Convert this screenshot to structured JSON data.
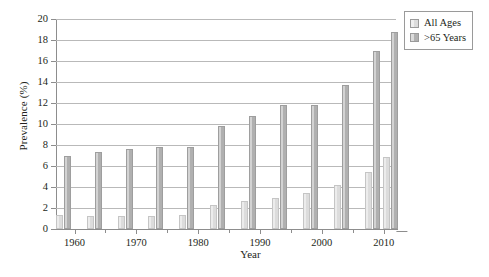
{
  "chart_data": {
    "type": "bar",
    "title": "",
    "xlabel": "Year",
    "ylabel": "Prevalence (%)",
    "grid": true,
    "legend_position": "top-right",
    "ylim": [
      0,
      20
    ],
    "yticks": [
      0,
      2,
      4,
      6,
      8,
      10,
      12,
      14,
      16,
      18,
      20
    ],
    "xlim": [
      1957,
      2012
    ],
    "xticks": [
      1960,
      1970,
      1980,
      1990,
      2000,
      2010
    ],
    "xtick_labels": [
      "1960",
      "1970",
      "1980",
      "1990",
      "2000",
      "2010"
    ],
    "categories": [
      1958,
      1963,
      1968,
      1973,
      1978,
      1983,
      1988,
      1993,
      1998,
      2003,
      2008,
      2011
    ],
    "series": [
      {
        "name": "All Ages",
        "color": "#dcdcdc",
        "values": [
          1.3,
          1.2,
          1.2,
          1.2,
          1.3,
          2.3,
          2.7,
          3.0,
          3.4,
          4.2,
          5.4,
          6.9
        ]
      },
      {
        "name": ">65 Years",
        "color": "#b0b0b0",
        "values": [
          7.0,
          7.3,
          7.6,
          7.8,
          7.8,
          9.8,
          10.8,
          11.8,
          11.8,
          13.7,
          17.0,
          18.8
        ]
      }
    ]
  },
  "legend": {
    "items": [
      {
        "label": "All Ages",
        "color": "#dcdcdc"
      },
      {
        "label": ">65 Years",
        "color": "#b0b0b0"
      }
    ]
  },
  "axes": {
    "y_title": "Prevalence (%)",
    "x_title": "Year"
  }
}
